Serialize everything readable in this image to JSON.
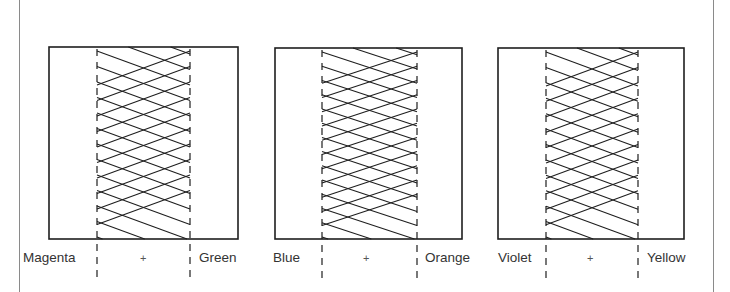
{
  "diagram": {
    "line_color": "#1e1e1e",
    "panels": [
      {
        "left_label": "Magenta",
        "operator": "+",
        "right_label": "Green",
        "box": {
          "x": 49,
          "y": 47,
          "w": 189,
          "h": 192
        },
        "dash_left_x": 97,
        "dash_right_x": 190,
        "zigzag_rows": 12
      },
      {
        "left_label": "Blue",
        "operator": "+",
        "right_label": "Orange",
        "box": {
          "x": 275,
          "y": 48,
          "w": 187,
          "h": 191
        },
        "dash_left_x": 322,
        "dash_right_x": 417,
        "zigzag_rows": 13
      },
      {
        "left_label": "Violet",
        "operator": "+",
        "right_label": "Yellow",
        "box": {
          "x": 498,
          "y": 48,
          "w": 186,
          "h": 191
        },
        "dash_left_x": 546,
        "dash_right_x": 638,
        "zigzag_rows": 12
      }
    ]
  }
}
